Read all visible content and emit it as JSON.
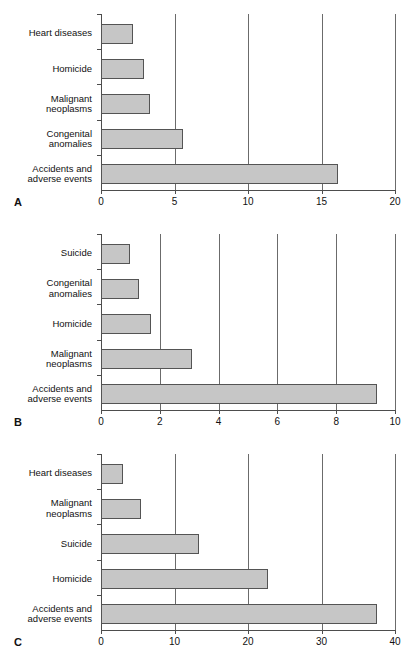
{
  "figure": {
    "panels": [
      {
        "letter": "A",
        "chart_data": {
          "type": "bar",
          "orientation": "horizontal",
          "title": "",
          "xlabel": "",
          "ylabel": "",
          "xlim": [
            0,
            20
          ],
          "xticks": [
            0,
            5,
            10,
            15,
            20
          ],
          "xtick_labels": [
            "0",
            "5",
            "10",
            "15",
            "20"
          ],
          "grid": true,
          "grid_axis": "x",
          "legend": false,
          "categories": [
            "Heart diseases",
            "Homicide",
            "Malignant neoplasms",
            "Congenital anomalies",
            "Accidents and adverse events"
          ],
          "category_lines": [
            [
              "Heart diseases"
            ],
            [
              "Homicide"
            ],
            [
              "Malignant",
              "neoplasms"
            ],
            [
              "Congenital",
              "anomalies"
            ],
            [
              "Accidents and",
              "adverse events"
            ]
          ],
          "values": [
            2.2,
            2.9,
            3.3,
            5.6,
            16.1
          ]
        }
      },
      {
        "letter": "B",
        "chart_data": {
          "type": "bar",
          "orientation": "horizontal",
          "title": "",
          "xlabel": "",
          "ylabel": "",
          "xlim": [
            0,
            10
          ],
          "xticks": [
            0,
            2,
            4,
            6,
            8,
            10
          ],
          "xtick_labels": [
            "0",
            "2",
            "4",
            "6",
            "8",
            "10"
          ],
          "grid": true,
          "grid_axis": "x",
          "legend": false,
          "categories": [
            "Suicide",
            "Congenital anomalies",
            "Homicide",
            "Malignant neoplasms",
            "Accidents and adverse events"
          ],
          "category_lines": [
            [
              "Suicide"
            ],
            [
              "Congenital",
              "anomalies"
            ],
            [
              "Homicide"
            ],
            [
              "Malignant",
              "neoplasms"
            ],
            [
              "Accidents and",
              "adverse events"
            ]
          ],
          "values": [
            1.0,
            1.3,
            1.7,
            3.1,
            9.4
          ]
        }
      },
      {
        "letter": "C",
        "chart_data": {
          "type": "bar",
          "orientation": "horizontal",
          "title": "",
          "xlabel": "",
          "ylabel": "",
          "xlim": [
            0,
            40
          ],
          "xticks": [
            0,
            10,
            20,
            30,
            40
          ],
          "xtick_labels": [
            "0",
            "10",
            "20",
            "30",
            "40"
          ],
          "grid": true,
          "grid_axis": "x",
          "legend": false,
          "categories": [
            "Heart diseases",
            "Malignant neoplasms",
            "Suicide",
            "Homicide",
            "Accidents and adverse events"
          ],
          "category_lines": [
            [
              "Heart diseases"
            ],
            [
              "Malignant",
              "neoplasms"
            ],
            [
              "Suicide"
            ],
            [
              "Homicide"
            ],
            [
              "Accidents and",
              "adverse events"
            ]
          ],
          "values": [
            3.0,
            5.4,
            13.4,
            22.7,
            37.6
          ]
        }
      }
    ]
  },
  "colors": {
    "bar_fill": "#c6c6c6",
    "bar_stroke": "#545454",
    "axis": "#4d4d4d",
    "grid": "#6b6b6b",
    "text": "#111111",
    "background": "#ffffff"
  }
}
